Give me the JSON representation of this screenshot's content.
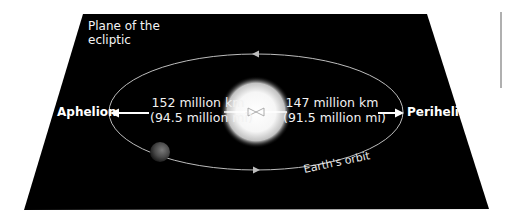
{
  "diagram": {
    "title": "Plane of the ecliptic",
    "plane_label_lines": [
      "Plane of the",
      "ecliptic"
    ],
    "aphelion": {
      "label": "Aphelion",
      "distance_km": "152 million km",
      "distance_mi": "(94.5 million mi)"
    },
    "perihelion": {
      "label": "Perihelion",
      "distance_km": "147 million km",
      "distance_mi": "(91.5 million mi)"
    },
    "orbit_label": "Earth's orbit",
    "objects": [
      "sun",
      "earth"
    ],
    "colors": {
      "background_plane": "#000000",
      "orbit_line": "#bdbdbd",
      "text": "#ffffff",
      "page_background": "#ffffff"
    }
  }
}
